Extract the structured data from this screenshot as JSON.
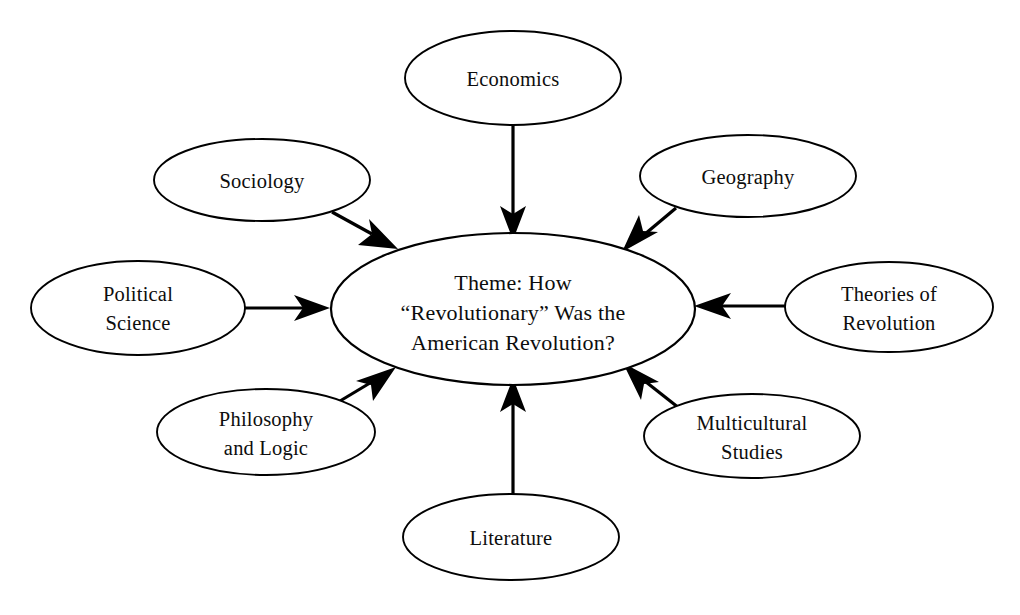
{
  "diagram": {
    "type": "concept-map",
    "title_node": {
      "id": "center",
      "lines": [
        "Theme: How",
        "“Revolutionary” Was the",
        "American Revolution?"
      ],
      "shape": "ellipse",
      "cx": 513,
      "cy": 309,
      "rx": 182,
      "ry": 76
    },
    "satellites": [
      {
        "id": "economics",
        "lines": [
          "Economics"
        ],
        "shape": "ellipse",
        "cx": 513,
        "cy": 78,
        "rx": 108,
        "ry": 47,
        "arrow": "down"
      },
      {
        "id": "sociology",
        "lines": [
          "Sociology"
        ],
        "shape": "ellipse",
        "cx": 262,
        "cy": 180,
        "rx": 108,
        "ry": 41,
        "arrow": "down-right"
      },
      {
        "id": "geography",
        "lines": [
          "Geography"
        ],
        "shape": "ellipse",
        "cx": 748,
        "cy": 176,
        "rx": 108,
        "ry": 41,
        "arrow": "down-left"
      },
      {
        "id": "political-science",
        "lines": [
          "Political",
          "Science"
        ],
        "shape": "ellipse",
        "cx": 138,
        "cy": 308,
        "rx": 107,
        "ry": 47,
        "arrow": "right"
      },
      {
        "id": "theories-of-revolution",
        "lines": [
          "Theories of",
          "Revolution"
        ],
        "shape": "ellipse",
        "cx": 889,
        "cy": 307,
        "rx": 104,
        "ry": 45,
        "arrow": "left"
      },
      {
        "id": "philosophy-and-logic",
        "lines": [
          "Philosophy",
          "and Logic"
        ],
        "shape": "ellipse",
        "cx": 266,
        "cy": 432,
        "rx": 109,
        "ry": 43,
        "arrow": "up-right"
      },
      {
        "id": "multicultural-studies",
        "lines": [
          "Multicultural",
          "Studies"
        ],
        "shape": "ellipse",
        "cx": 752,
        "cy": 436,
        "rx": 108,
        "ry": 42,
        "arrow": "up-left"
      },
      {
        "id": "literature",
        "lines": [
          "Literature"
        ],
        "shape": "ellipse",
        "cx": 511,
        "cy": 537,
        "rx": 108,
        "ry": 43,
        "arrow": "up"
      }
    ],
    "colors": {
      "stroke": "#000000",
      "fill": "#ffffff",
      "text": "#0d0d0d",
      "background": "#ffffff"
    }
  }
}
